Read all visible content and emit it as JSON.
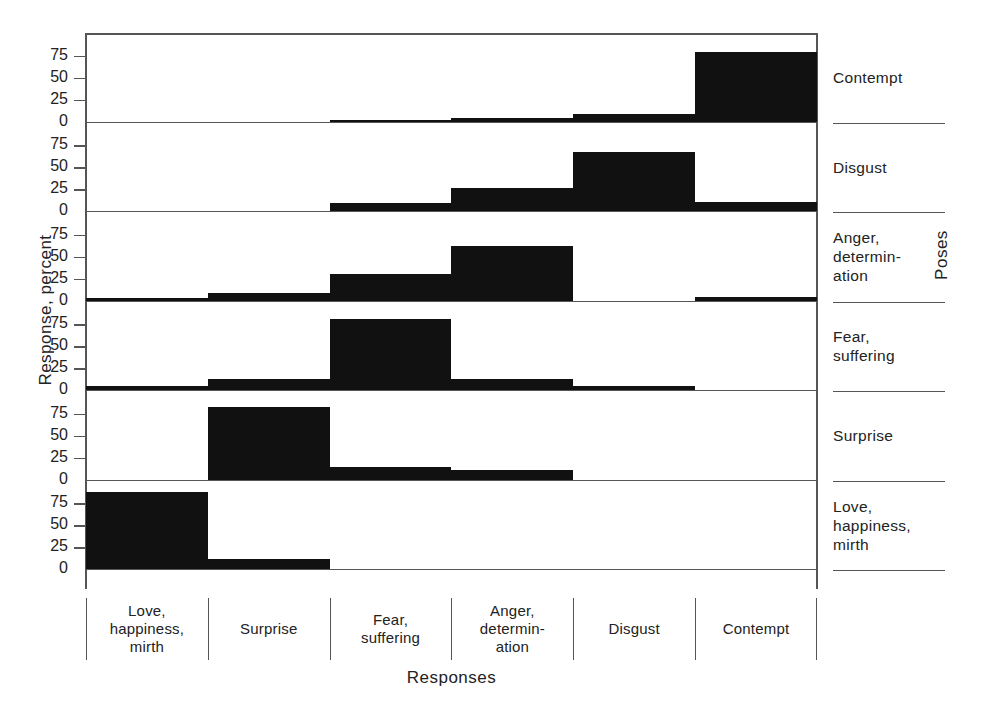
{
  "chart_data": {
    "type": "bar",
    "title": "",
    "xlabel": "Responses",
    "ylabel": "Response, percent",
    "right_axis_label": "Poses",
    "ylim": [
      0,
      100
    ],
    "yticks": [
      0,
      25,
      50,
      75
    ],
    "ytick_labels": [
      "0",
      "25",
      "50",
      "75"
    ],
    "grid": false,
    "legend": "none",
    "categories": [
      "Love,\nhappiness,\nmirth",
      "Surprise",
      "Fear,\nsuffering",
      "Anger,\ndetermin-\nation",
      "Disgust",
      "Contempt"
    ],
    "panel_order_top_to_bottom": [
      "Contempt",
      "Disgust",
      "Anger, determination",
      "Fear, suffering",
      "Surprise",
      "Love, happiness, mirth"
    ],
    "series": [
      {
        "name": "Contempt",
        "values": [
          0,
          0,
          2,
          4,
          9,
          79
        ]
      },
      {
        "name": "Disgust",
        "values": [
          0,
          0,
          9,
          26,
          67,
          10
        ]
      },
      {
        "name": "Anger, determination",
        "values": [
          3,
          8,
          30,
          62,
          0,
          4
        ]
      },
      {
        "name": "Fear, suffering",
        "values": [
          4,
          12,
          81,
          13,
          4,
          0
        ]
      },
      {
        "name": "Surprise",
        "values": [
          0,
          82,
          14,
          11,
          0,
          0
        ]
      },
      {
        "name": "Love, happiness, mirth",
        "values": [
          88,
          11,
          0,
          0,
          0,
          0
        ]
      }
    ]
  },
  "axes": {
    "y_title": "Response, percent",
    "x_title": "Responses",
    "right_title": "Poses",
    "tick_values": [
      "75",
      "50",
      "25",
      "0"
    ]
  },
  "panels": [
    {
      "id": "contempt",
      "label_lines": [
        "Contempt"
      ]
    },
    {
      "id": "disgust",
      "label_lines": [
        "Disgust"
      ]
    },
    {
      "id": "anger",
      "label_lines": [
        "Anger,",
        "determin-",
        "ation"
      ]
    },
    {
      "id": "fear",
      "label_lines": [
        "Fear,",
        "suffering"
      ]
    },
    {
      "id": "surprise",
      "label_lines": [
        "Surprise"
      ]
    },
    {
      "id": "love",
      "label_lines": [
        "Love,",
        "happiness,",
        "mirth"
      ]
    }
  ],
  "x_categories": [
    {
      "id": "love",
      "lines": [
        "Love,",
        "happiness,",
        "mirth"
      ]
    },
    {
      "id": "surprise",
      "lines": [
        "Surprise"
      ]
    },
    {
      "id": "fear",
      "lines": [
        "Fear,",
        "suffering"
      ]
    },
    {
      "id": "anger",
      "lines": [
        "Anger,",
        "determin-",
        "ation"
      ]
    },
    {
      "id": "disgust",
      "lines": [
        "Disgust"
      ]
    },
    {
      "id": "contempt",
      "lines": [
        "Contempt"
      ]
    }
  ],
  "style": {
    "bar_color": "#111111",
    "axis_color": "#555555",
    "text_color": "#222222",
    "background": "#ffffff"
  }
}
